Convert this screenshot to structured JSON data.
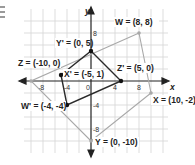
{
  "figure": {
    "type": "coordinate-plane",
    "axes": {
      "x_label": "x",
      "y_label": "y"
    },
    "tick_labels": {
      "x": [
        "-8",
        "-4",
        "0",
        "4",
        "8"
      ],
      "y": [
        "8",
        "4",
        "-4",
        "-8"
      ]
    },
    "outer_quadrilateral": {
      "vertices": [
        {
          "name": "W",
          "label": "W = (8, 8)",
          "x": 8,
          "y": 8
        },
        {
          "name": "X",
          "label": "X = (10, -2)",
          "x": 10,
          "y": -2
        },
        {
          "name": "Y",
          "label": "Y = (0, -10)",
          "x": 0,
          "y": -10
        },
        {
          "name": "Z",
          "label": "Z = (-10, 0)",
          "x": -10,
          "y": 0
        }
      ],
      "color": "#a8a8a8"
    },
    "midpoint_quadrilateral": {
      "vertices": [
        {
          "name": "Y'",
          "label": "Y' = (0, 5)",
          "x": 0,
          "y": 5
        },
        {
          "name": "Z'",
          "label": "Z' = (5, 0)",
          "x": 5,
          "y": 0
        },
        {
          "name": "W'",
          "label": "W' = (-4, -4)",
          "x": -4,
          "y": -4
        },
        {
          "name": "X'",
          "label": "X' = (-5, 1)",
          "x": -5,
          "y": 1
        }
      ],
      "color": "#2a2a2a"
    },
    "grid_color": "#d4d4d4",
    "axis_color": "#222222"
  },
  "labels": {
    "W": "W = (8, 8)",
    "X": "X = (10, -2)",
    "Y": "Y = (0, -10)",
    "Z": "Z = (-10, 0)",
    "Yp": "Y' = (0, 5)",
    "Zp": "Z' = (5, 0)",
    "Wp": "W' = (-4, -4)",
    "Xp": "X' = (-5, 1)",
    "xaxis": "x",
    "yaxis": "y",
    "t_xm8": "-8",
    "t_xm4": "-4",
    "t_x0": "0",
    "t_x4": "4",
    "t_x8": "8",
    "t_y8": "8",
    "t_ym4": "-4",
    "t_ym8": "-8"
  }
}
